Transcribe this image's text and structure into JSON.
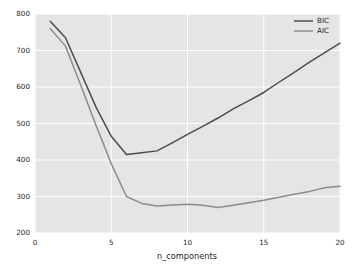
{
  "chart_data": {
    "type": "line",
    "title": "",
    "xlabel": "n_components",
    "ylabel": "",
    "xlim": [
      0,
      20
    ],
    "ylim": [
      200,
      800
    ],
    "xticks": [
      0,
      5,
      10,
      15,
      20
    ],
    "yticks": [
      200,
      300,
      400,
      500,
      600,
      700,
      800
    ],
    "xtick_labels": [
      "0",
      "5",
      "10",
      "15",
      "20"
    ],
    "ytick_labels": [
      "200",
      "300",
      "400",
      "500",
      "600",
      "700",
      "800"
    ],
    "grid": true,
    "legend_position": "upper right",
    "x": [
      1,
      2,
      3,
      4,
      5,
      6,
      7,
      8,
      9,
      10,
      11,
      12,
      13,
      14,
      15,
      16,
      17,
      18,
      19,
      20
    ],
    "series": [
      {
        "name": "BIC",
        "color": "#4c4c4c",
        "values": [
          780,
          735,
          640,
          545,
          465,
          415,
          420,
          425,
          447,
          470,
          492,
          515,
          540,
          562,
          585,
          613,
          640,
          668,
          694,
          720
        ]
      },
      {
        "name": "AIC",
        "color": "#8c8c8c",
        "values": [
          760,
          712,
          605,
          495,
          390,
          300,
          281,
          274,
          277,
          279,
          276,
          270,
          276,
          283,
          290,
          298,
          306,
          314,
          324,
          328
        ]
      }
    ]
  },
  "legend": {
    "entries": [
      {
        "label": "BIC"
      },
      {
        "label": "AIC"
      }
    ]
  },
  "style": {
    "figure_background": "#ffffff",
    "axes_background": "#e5e5e5",
    "grid_color": "#ffffff",
    "text_color": "#262626"
  }
}
